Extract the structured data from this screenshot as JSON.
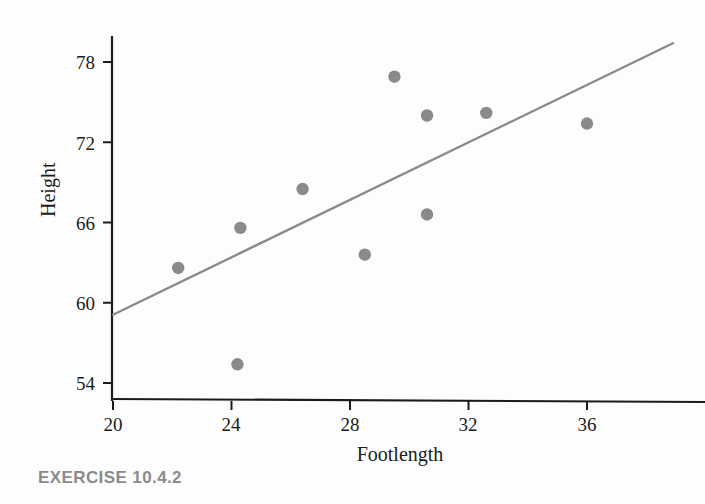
{
  "caption": "EXERCISE 10.4.2",
  "colors": {
    "axis": "#1b1b1b",
    "point": "#8a8a8a",
    "trendline": "#8a8a8a",
    "tick_text": "#1b1b1b",
    "caption_text": "#8b8b8b",
    "background": "#fdfdfd"
  },
  "chart_data": {
    "type": "scatter",
    "title": "",
    "xlabel": "Footlength",
    "ylabel": "Height",
    "xlim": [
      20,
      38
    ],
    "ylim": [
      52.5,
      79.5
    ],
    "xticks": [
      20,
      24,
      28,
      32,
      36
    ],
    "yticks": [
      54,
      60,
      66,
      72,
      78
    ],
    "xtick_labels": [
      "20",
      "24",
      "28",
      "32",
      "36"
    ],
    "ytick_labels": [
      "54",
      "60",
      "66",
      "72",
      "78"
    ],
    "grid": false,
    "legend": "none",
    "marker": "filled-circle",
    "series": [
      {
        "name": "observations",
        "points": [
          {
            "x": 22.2,
            "y": 62.6
          },
          {
            "x": 24.3,
            "y": 65.6
          },
          {
            "x": 24.2,
            "y": 55.4
          },
          {
            "x": 26.4,
            "y": 68.5
          },
          {
            "x": 28.5,
            "y": 63.6
          },
          {
            "x": 29.5,
            "y": 76.9
          },
          {
            "x": 30.6,
            "y": 74.0
          },
          {
            "x": 30.6,
            "y": 66.6
          },
          {
            "x": 32.6,
            "y": 74.2
          },
          {
            "x": 36.0,
            "y": 73.4
          }
        ]
      }
    ],
    "trendline": {
      "type": "linear-regression",
      "x_start": 20.0,
      "y_start": 59.1,
      "x_end": 38.9,
      "y_end": 79.4
    }
  }
}
